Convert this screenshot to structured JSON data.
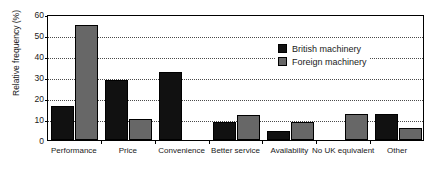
{
  "chart_data": {
    "type": "bar",
    "title": "",
    "xlabel": "",
    "ylabel": "Relative frequency (%)",
    "ylim": [
      0,
      60
    ],
    "ytick_values": [
      0,
      10,
      20,
      30,
      40,
      50,
      60
    ],
    "ytick_labels": [
      "0",
      "10",
      "20",
      "30",
      "40",
      "50",
      "60"
    ],
    "grid": "horizontal-dotted",
    "legend_position": "upper-right-inside",
    "categories": [
      "Performance",
      "Price",
      "Convenience",
      "Better service",
      "Availability",
      "No UK equivalent",
      "Other"
    ],
    "series": [
      {
        "name": "British machinery",
        "color": "#111111",
        "values": [
          16,
          28.5,
          32.5,
          8.5,
          4.5,
          0,
          12.5
        ]
      },
      {
        "name": "Foreign machinery",
        "color": "#676767",
        "values": [
          55,
          10,
          0,
          12,
          8.5,
          12.5,
          5.5
        ]
      }
    ]
  },
  "legend": {
    "entries": [
      {
        "label": "British machinery",
        "swatch": "black-square-swatch"
      },
      {
        "label": "Foreign machinery",
        "swatch": "gray-square-swatch"
      }
    ]
  }
}
